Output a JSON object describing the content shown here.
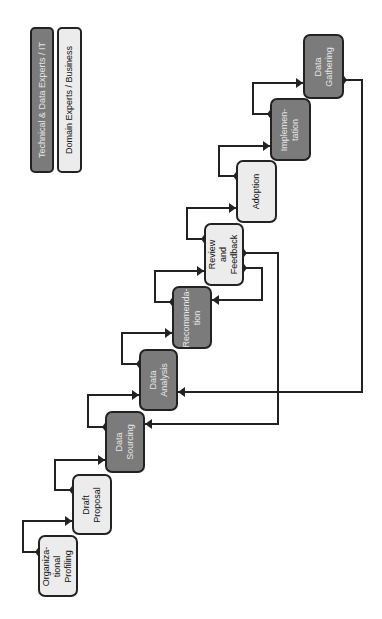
{
  "legend": [
    {
      "label": "Technical & Data Experts / IT",
      "type": "tech",
      "x": 30,
      "y": 27,
      "w": 24,
      "h": 146
    },
    {
      "label": "Domain Experts / Business",
      "type": "domain",
      "x": 57,
      "y": 27,
      "w": 25,
      "h": 146
    }
  ],
  "colors": {
    "tech_fill": "#7b7b7b",
    "domain_fill": "#ececec",
    "stroke": "#222222"
  },
  "nodes": [
    {
      "id": "org",
      "label": "Organiza-\ntional\nProfiling",
      "type": "domain",
      "x": 38,
      "y": 535,
      "w": 40,
      "h": 62
    },
    {
      "id": "draft",
      "label": "Draft\nProposal",
      "type": "domain",
      "x": 72,
      "y": 474,
      "w": 40,
      "h": 61
    },
    {
      "id": "sourcing",
      "label": "Data\nSourcing",
      "type": "tech",
      "x": 105,
      "y": 411,
      "w": 40,
      "h": 62
    },
    {
      "id": "analysis",
      "label": "Data\nAnalysis",
      "type": "tech",
      "x": 139,
      "y": 349,
      "w": 39,
      "h": 62
    },
    {
      "id": "recommendation",
      "label": "Recommenda-\ntion",
      "type": "tech",
      "x": 172,
      "y": 286,
      "w": 40,
      "h": 63
    },
    {
      "id": "review",
      "label": "Review\nand\nFeedback",
      "type": "domain",
      "x": 204,
      "y": 223,
      "w": 40,
      "h": 63
    },
    {
      "id": "adoption",
      "label": "Adoption",
      "type": "domain",
      "x": 236,
      "y": 160,
      "w": 41,
      "h": 63
    },
    {
      "id": "implementation",
      "label": "Implemen-\ntation",
      "type": "tech",
      "x": 270,
      "y": 98,
      "w": 41,
      "h": 63
    },
    {
      "id": "gathering",
      "label": "Data\nGathering",
      "type": "tech",
      "x": 303,
      "y": 34,
      "w": 41,
      "h": 65
    }
  ],
  "edges": [
    {
      "from": "org",
      "to": "draft",
      "points": [
        [
          38,
          552
        ],
        [
          23,
          552
        ],
        [
          23,
          521
        ],
        [
          72,
          521
        ]
      ]
    },
    {
      "from": "draft",
      "to": "sourcing",
      "points": [
        [
          72,
          490
        ],
        [
          55,
          490
        ],
        [
          55,
          460
        ],
        [
          105,
          460
        ]
      ]
    },
    {
      "from": "sourcing",
      "to": "analysis",
      "points": [
        [
          105,
          427
        ],
        [
          88,
          427
        ],
        [
          88,
          395
        ],
        [
          139,
          395
        ]
      ]
    },
    {
      "from": "analysis",
      "to": "recommendation",
      "points": [
        [
          139,
          364
        ],
        [
          122,
          364
        ],
        [
          122,
          333
        ],
        [
          172,
          333
        ]
      ]
    },
    {
      "from": "recommendation",
      "to": "review",
      "points": [
        [
          172,
          302
        ],
        [
          155,
          302
        ],
        [
          155,
          271
        ],
        [
          204,
          271
        ]
      ]
    },
    {
      "from": "review",
      "to": "adoption",
      "points": [
        [
          204,
          239
        ],
        [
          187,
          239
        ],
        [
          187,
          208
        ],
        [
          236,
          208
        ]
      ]
    },
    {
      "from": "adoption",
      "to": "implementation",
      "points": [
        [
          236,
          176
        ],
        [
          219,
          176
        ],
        [
          219,
          146
        ],
        [
          270,
          146
        ]
      ]
    },
    {
      "from": "implementation",
      "to": "gathering",
      "points": [
        [
          270,
          114
        ],
        [
          253,
          114
        ],
        [
          253,
          83
        ],
        [
          303,
          83
        ]
      ]
    },
    {
      "from": "review",
      "to": "recommendation",
      "points": [
        [
          244,
          268
        ],
        [
          262,
          268
        ],
        [
          262,
          300
        ],
        [
          212,
          300
        ]
      ]
    },
    {
      "from": "review",
      "to": "sourcing",
      "points": [
        [
          244,
          253
        ],
        [
          278,
          253
        ],
        [
          278,
          424
        ],
        [
          145,
          424
        ]
      ]
    },
    {
      "from": "gathering",
      "to": "analysis",
      "points": [
        [
          344,
          80
        ],
        [
          362,
          80
        ],
        [
          362,
          392
        ],
        [
          178,
          392
        ]
      ]
    }
  ]
}
